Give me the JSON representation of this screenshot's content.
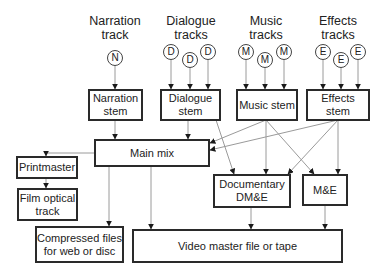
{
  "headers": {
    "narration": "Narration track",
    "dialogue": "Dialogue tracks",
    "music": "Music tracks",
    "effects": "Effects tracks"
  },
  "circles": {
    "narration": [
      "N"
    ],
    "dialogue": [
      "D",
      "D",
      "D"
    ],
    "music": [
      "M",
      "M",
      "M"
    ],
    "effects": [
      "E",
      "E",
      "E"
    ]
  },
  "boxes": {
    "narration_stem": "Narration stem",
    "dialogue_stem": "Dialogue stem",
    "music_stem": "Music stem",
    "effects_stem": "Effects stem",
    "main_mix": "Main mix",
    "printmaster": "Printmaster",
    "film_optical": "Film optical track",
    "documentary": "Documentary DM&E",
    "me": "M&E",
    "compressed": "Compressed files for web or disc",
    "video_master": "Video master file or tape"
  },
  "colors": {
    "box_border": "#2a2a2a",
    "arrow_line": "#9a9a9a",
    "arrow_head": "#1a1a1a"
  }
}
